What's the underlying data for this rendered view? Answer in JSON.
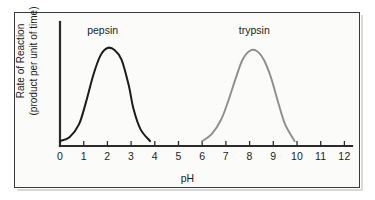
{
  "figure": {
    "frame_color": "#3a3a3a",
    "background_color": "#fbfbfa"
  },
  "chart_data": {
    "type": "line",
    "title": "",
    "xlabel": "pH",
    "ylabel_line1": "Rate of Reaction",
    "ylabel_line2": "(product per unit of time)",
    "xlim": [
      0,
      12.4
    ],
    "ylim": [
      0,
      1.12
    ],
    "xticks": [
      "0",
      "1",
      "2",
      "3",
      "4",
      "5",
      "6",
      "7",
      "8",
      "9",
      "10",
      "11",
      "12"
    ],
    "xtick_values": [
      0,
      1,
      2,
      3,
      4,
      5,
      6,
      7,
      8,
      9,
      10,
      11,
      12
    ],
    "yticks": [],
    "grid": false,
    "legend": "inline-curve-labels",
    "series": [
      {
        "name": "pepsin",
        "color": "#1c1c1c",
        "label_x": 1.8,
        "optimum_ph": 2.0,
        "ph_range": [
          0.0,
          3.8
        ],
        "x": [
          0.0,
          0.4,
          0.8,
          1.1,
          1.4,
          1.7,
          2.0,
          2.3,
          2.6,
          2.9,
          3.1,
          3.4,
          3.8
        ],
        "y": [
          0.05,
          0.09,
          0.22,
          0.45,
          0.72,
          0.92,
          1.0,
          0.98,
          0.88,
          0.62,
          0.38,
          0.17,
          0.05
        ]
      },
      {
        "name": "trypsin",
        "color": "#8e8e8e",
        "label_x": 8.2,
        "optimum_ph": 8.2,
        "ph_range": [
          6.0,
          9.9
        ],
        "x": [
          6.0,
          6.4,
          6.8,
          7.1,
          7.4,
          7.7,
          8.0,
          8.3,
          8.6,
          8.9,
          9.2,
          9.5,
          9.9
        ],
        "y": [
          0.05,
          0.12,
          0.27,
          0.46,
          0.68,
          0.88,
          0.97,
          0.97,
          0.88,
          0.7,
          0.45,
          0.22,
          0.05
        ]
      }
    ]
  }
}
